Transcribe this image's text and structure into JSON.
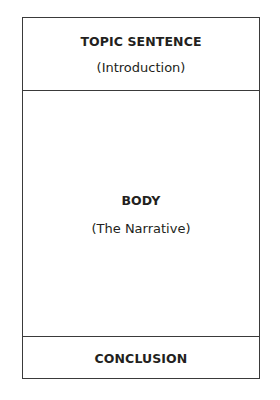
{
  "diagram": {
    "type": "paragraph-structure",
    "sections": [
      {
        "title": "TOPIC SENTENCE",
        "subtitle": "(Introduction)"
      },
      {
        "title": "BODY",
        "subtitle": "(The Narrative)"
      },
      {
        "title": "CONCLUSION"
      }
    ]
  }
}
